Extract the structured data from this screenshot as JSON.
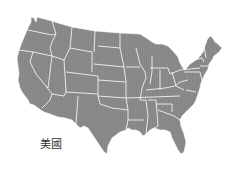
{
  "map": {
    "country_label": "美國",
    "fill_color": "#8a8a8a",
    "border_color": "#ffffff",
    "background": "#ffffff"
  }
}
